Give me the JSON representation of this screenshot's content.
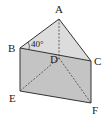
{
  "figure": {
    "type": "triangular-prism",
    "vertices": {
      "A": {
        "label": "A",
        "x": 59,
        "y": 19
      },
      "B": {
        "label": "B",
        "x": 20,
        "y": 48
      },
      "C": {
        "label": "C",
        "x": 91,
        "y": 61
      },
      "D": {
        "label": "D",
        "x": 59,
        "y": 58
      },
      "E": {
        "label": "E",
        "x": 20,
        "y": 91
      },
      "F": {
        "label": "F",
        "x": 91,
        "y": 103
      }
    },
    "angle_label": "40°",
    "hidden_edges": [
      "AD",
      "DE",
      "DF"
    ],
    "colors": {
      "top_face": "#d6d6d6",
      "front_face": "#c2c2c2",
      "edge": "#333333"
    }
  }
}
